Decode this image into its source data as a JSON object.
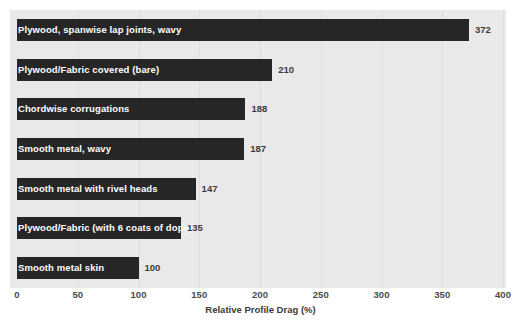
{
  "chart_data": {
    "type": "bar",
    "orientation": "horizontal",
    "title": "",
    "xlabel": "Relative Profile Drag (%)",
    "ylabel": "",
    "xlim": [
      0,
      400
    ],
    "xticks": [
      0,
      50,
      100,
      150,
      200,
      250,
      300,
      350,
      400
    ],
    "xtick_labels": [
      "0",
      "50",
      "100",
      "150",
      "200",
      "250",
      "300",
      "350",
      "400"
    ],
    "grid": true,
    "legend": "none",
    "categories": [
      "Plywood, spanwise lap joints, wavy",
      "Plywood/Fabric covered (bare)",
      "Chordwise corrugations",
      "Smooth metal, wavy",
      "Smooth metal with rivel heads",
      "Plywood/Fabric (with 6 coats of dope)",
      "Smooth metal skin"
    ],
    "values": [
      372,
      210,
      188,
      187,
      147,
      135,
      100
    ],
    "value_labels": [
      "372",
      "210",
      "188",
      "187",
      "147",
      "135",
      "100"
    ],
    "colors": {
      "bar": "#262626",
      "bar_label_text": "#ffffff",
      "value_label_text": "#3b3b3b",
      "plot_background": "#e9e9e9",
      "figure_background": "#ffffff",
      "gridline": "#dcdcdc",
      "axis_text": "#4a4a4a"
    }
  }
}
